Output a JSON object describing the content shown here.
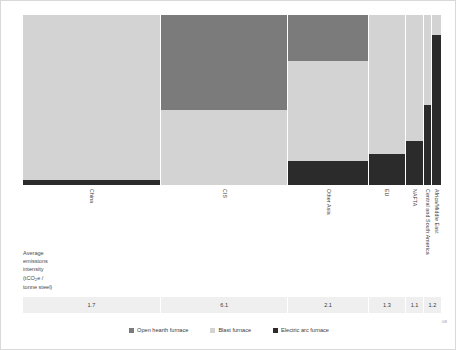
{
  "caption": {
    "lines": [
      "Average",
      "emissions",
      "intensity",
      "(tCO",
      "e /",
      "tonne steel)"
    ],
    "l1": "Average",
    "l2": "emissions",
    "l3": "intensity",
    "l4_pre": "(tCO",
    "l4_sub": "2",
    "l4_post": "e /",
    "l5": "tonne steel)"
  },
  "legend": {
    "items": [
      {
        "label": "Open hearth furnace",
        "color": "#7b7b7b",
        "key": "ohf"
      },
      {
        "label": "Blast furnace",
        "color": "#d3d3d3",
        "key": "bf"
      },
      {
        "label": "Electric arc furnace",
        "color": "#2b2b2b",
        "key": "eaf"
      }
    ]
  },
  "corner_mark": "08",
  "chart_data": {
    "type": "bar",
    "subtype": "marimekko",
    "title": "",
    "xlabel": "",
    "ylabel": "Average emissions intensity (tCO2e / tonne steel)",
    "grid": false,
    "legend_position": "bottom",
    "ylim": [
      0,
      100
    ],
    "categories": [
      "China",
      "CIS",
      "Other Asia",
      "EU",
      "NAFTA",
      "Central and South America",
      "Africa/Middle East"
    ],
    "category_labels": [
      [
        "China"
      ],
      [
        "CIS"
      ],
      [
        "Other Asia"
      ],
      [
        "EU"
      ],
      [
        "NAFTA"
      ],
      [
        "Central and South America"
      ],
      [
        "Africa/Middle East"
      ]
    ],
    "column_widths_pct": [
      33.0,
      30.5,
      19.2,
      9.0,
      4.2,
      2.0,
      2.1
    ],
    "emissions_intensity": [
      1.7,
      6.1,
      2.1,
      1.3,
      1.1,
      1.2
    ],
    "emissions_intensity_labels": [
      "1.7",
      "6.1",
      "2.1",
      "1.3",
      "1.1",
      "1.2"
    ],
    "value_cell_widths_pct": [
      33.0,
      30.5,
      19.2,
      9.0,
      4.2,
      4.1
    ],
    "series": [
      {
        "name": "Open hearth furnace",
        "color": "#7b7b7b",
        "values": [
          0,
          56,
          27,
          0,
          0,
          0,
          0
        ]
      },
      {
        "name": "Blast furnace",
        "color": "#d3d3d3",
        "values": [
          97,
          44,
          59,
          82,
          74,
          53,
          12
        ]
      },
      {
        "name": "Electric arc furnace",
        "color": "#2b2b2b",
        "values": [
          3,
          0,
          14,
          18,
          26,
          47,
          88
        ]
      }
    ]
  }
}
